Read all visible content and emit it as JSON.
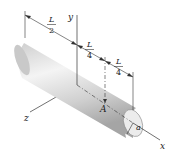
{
  "diagram": {
    "axes": {
      "x": "x",
      "y": "y",
      "z": "z"
    },
    "point_label": "A",
    "radius_label": "a",
    "dimensions": [
      {
        "num": "L",
        "den": "2"
      },
      {
        "num": "L",
        "den": "4"
      },
      {
        "num": "L",
        "den": "4"
      }
    ],
    "colors": {
      "rod_light": "#f2f2f2",
      "rod_mid": "#d4d4d4",
      "rod_dark": "#9a9a9a",
      "line": "#333333"
    }
  }
}
